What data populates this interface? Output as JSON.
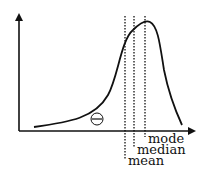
{
  "diagram": {
    "type": "left-skewed distribution",
    "skew_symbol": "⊖",
    "labels": {
      "mode": "mode",
      "median": "median",
      "mean": "mean"
    },
    "colors": {
      "ink": "#111111",
      "background": "#ffffff"
    }
  }
}
